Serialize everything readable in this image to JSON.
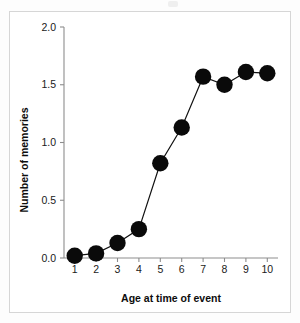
{
  "figure": {
    "background_color": "#ffffff",
    "frame_color": "#d6d6d6",
    "marker_color": "#0a0a0a",
    "line_color": "#111111",
    "axis_color": "#8d8d8d"
  },
  "chart_data": {
    "type": "line",
    "title": "",
    "xlabel": "Age at time of event",
    "ylabel": "Number of memories",
    "x": [
      1,
      2,
      3,
      4,
      5,
      6,
      7,
      8,
      9,
      10
    ],
    "xticklabels": [
      "1",
      "2",
      "3",
      "4",
      "5",
      "6",
      "7",
      "8",
      "9",
      "10"
    ],
    "values": [
      0.02,
      0.04,
      0.13,
      0.25,
      0.82,
      1.13,
      1.57,
      1.5,
      1.61,
      1.6
    ],
    "yticks": [
      0.0,
      0.5,
      1.0,
      1.5,
      2.0
    ],
    "yticklabels": [
      "0.0",
      "0.5",
      "1.0",
      "1.5",
      "2.0"
    ],
    "xlim": [
      0.5,
      10.5
    ],
    "ylim": [
      0.0,
      2.0
    ],
    "grid": false,
    "legend": null,
    "marker": "circle",
    "series": [
      {
        "name": "Number of memories",
        "values": [
          0.02,
          0.04,
          0.13,
          0.25,
          0.82,
          1.13,
          1.57,
          1.5,
          1.61,
          1.6
        ]
      }
    ]
  }
}
